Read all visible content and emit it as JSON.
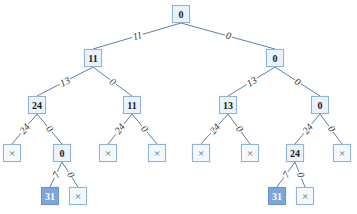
{
  "diagram": {
    "type": "tree",
    "colors": {
      "edge": "#5b7fa8",
      "node_border": "#8fb3d9",
      "node_fill": "#eaf3fb",
      "highlight_fill": "#7fa6d9",
      "caption": "#2b5fa6"
    },
    "nodes": [
      {
        "id": "n0",
        "label": "0",
        "x": 181,
        "y": 14,
        "kind": "value"
      },
      {
        "id": "n1",
        "label": "11",
        "x": 93,
        "y": 58,
        "kind": "value"
      },
      {
        "id": "n2",
        "label": "0",
        "x": 275,
        "y": 58,
        "kind": "value"
      },
      {
        "id": "n3",
        "label": "24",
        "x": 37,
        "y": 105,
        "kind": "value"
      },
      {
        "id": "n4",
        "label": "11",
        "x": 132,
        "y": 105,
        "kind": "value"
      },
      {
        "id": "n5",
        "label": "13",
        "x": 228,
        "y": 105,
        "kind": "value"
      },
      {
        "id": "n6",
        "label": "0",
        "x": 320,
        "y": 105,
        "kind": "value"
      },
      {
        "id": "n7",
        "label": "×",
        "x": 12,
        "y": 153,
        "kind": "null"
      },
      {
        "id": "n8",
        "label": "0",
        "x": 62,
        "y": 153,
        "kind": "value"
      },
      {
        "id": "n9",
        "label": "×",
        "x": 108,
        "y": 153,
        "kind": "null"
      },
      {
        "id": "n10",
        "label": "×",
        "x": 157,
        "y": 153,
        "kind": "null"
      },
      {
        "id": "n11",
        "label": "×",
        "x": 201,
        "y": 153,
        "kind": "null"
      },
      {
        "id": "n12",
        "label": "×",
        "x": 250,
        "y": 153,
        "kind": "null"
      },
      {
        "id": "n13",
        "label": "24",
        "x": 295,
        "y": 153,
        "kind": "value"
      },
      {
        "id": "n14",
        "label": "×",
        "x": 342,
        "y": 153,
        "kind": "null"
      },
      {
        "id": "n15",
        "label": "31",
        "x": 50,
        "y": 196,
        "kind": "highlight"
      },
      {
        "id": "n16",
        "label": "×",
        "x": 78,
        "y": 196,
        "kind": "null"
      },
      {
        "id": "n17",
        "label": "31",
        "x": 277,
        "y": 196,
        "kind": "highlight"
      },
      {
        "id": "n18",
        "label": "×",
        "x": 305,
        "y": 196,
        "kind": "null"
      }
    ],
    "edges": [
      {
        "from": "n0",
        "to": "n1",
        "label": "11"
      },
      {
        "from": "n0",
        "to": "n2",
        "label": "0"
      },
      {
        "from": "n1",
        "to": "n3",
        "label": "13"
      },
      {
        "from": "n1",
        "to": "n4",
        "label": "0"
      },
      {
        "from": "n2",
        "to": "n5",
        "label": "13"
      },
      {
        "from": "n2",
        "to": "n6",
        "label": "0"
      },
      {
        "from": "n3",
        "to": "n7",
        "label": "24"
      },
      {
        "from": "n3",
        "to": "n8",
        "label": "0"
      },
      {
        "from": "n4",
        "to": "n9",
        "label": "24"
      },
      {
        "from": "n4",
        "to": "n10",
        "label": "0"
      },
      {
        "from": "n5",
        "to": "n11",
        "label": "24"
      },
      {
        "from": "n5",
        "to": "n12",
        "label": "0"
      },
      {
        "from": "n6",
        "to": "n13",
        "label": "24"
      },
      {
        "from": "n6",
        "to": "n14",
        "label": "0"
      },
      {
        "from": "n8",
        "to": "n15",
        "label": "7"
      },
      {
        "from": "n8",
        "to": "n16",
        "label": "0"
      },
      {
        "from": "n13",
        "to": "n17",
        "label": "7"
      },
      {
        "from": "n13",
        "to": "n18",
        "label": "0"
      }
    ]
  },
  "caption": {
    "text": "",
    "note": "caption partially cut off at bottom edge"
  }
}
